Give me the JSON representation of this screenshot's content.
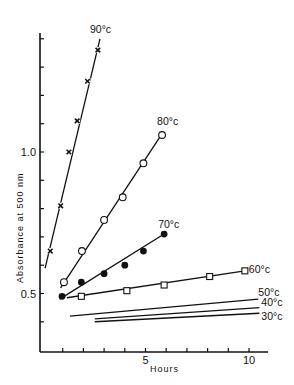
{
  "chart_data": {
    "type": "scatter",
    "title": "",
    "xlabel": "Hours",
    "ylabel": "Absorbance at 500 nm",
    "xlim": [
      0,
      11
    ],
    "ylim": [
      0.29,
      1.41
    ],
    "x_ticks": [
      1,
      2,
      3,
      4,
      5,
      6,
      7,
      8,
      9,
      10
    ],
    "x_tick_labels": [
      {
        "value": 5,
        "label": "5"
      },
      {
        "value": 10,
        "label": "10"
      }
    ],
    "y_ticks": [
      0.4,
      0.5,
      0.6,
      0.7,
      0.8,
      0.9,
      1.0,
      1.1,
      1.2,
      1.3,
      1.4
    ],
    "y_tick_labels": [
      {
        "value": 0.5,
        "label": "0.5"
      },
      {
        "value": 1.0,
        "label": "1.0"
      }
    ],
    "grid": false,
    "legend": "inline labels at line ends",
    "series": [
      {
        "name": "90°c",
        "marker": "cross",
        "x": [
          0.4,
          0.9,
          1.3,
          1.7,
          2.2,
          2.7
        ],
        "y": [
          0.65,
          0.81,
          1.0,
          1.11,
          1.25,
          1.36
        ],
        "fit_line": {
          "x": [
            0.15,
            2.8
          ],
          "y": [
            0.59,
            1.4
          ]
        }
      },
      {
        "name": "80°c",
        "marker": "open-circle",
        "x": [
          1.06,
          1.93,
          3.0,
          3.9,
          4.9,
          5.8
        ],
        "y": [
          0.54,
          0.65,
          0.76,
          0.84,
          0.96,
          1.06
        ],
        "fit_line": {
          "x": [
            0.9,
            5.85
          ],
          "y": [
            0.52,
            1.07
          ]
        }
      },
      {
        "name": "70°c",
        "marker": "filled-circle",
        "x": [
          0.97,
          1.9,
          3.0,
          4.0,
          4.9,
          5.9
        ],
        "y": [
          0.49,
          0.54,
          0.57,
          0.6,
          0.65,
          0.71
        ],
        "fit_line": {
          "x": [
            0.85,
            5.9
          ],
          "y": [
            0.48,
            0.71
          ]
        }
      },
      {
        "name": "60°c",
        "marker": "open-square",
        "x": [
          1.9,
          4.1,
          5.9,
          8.1,
          9.8
        ],
        "y": [
          0.49,
          0.51,
          0.53,
          0.56,
          0.58
        ],
        "fit_line": {
          "x": [
            1.2,
            9.8
          ],
          "y": [
            0.485,
            0.58
          ]
        }
      },
      {
        "name": "50°c",
        "marker": "none",
        "x": [],
        "y": [],
        "fit_line": {
          "x": [
            1.35,
            10.45
          ],
          "y": [
            0.42,
            0.48
          ]
        }
      },
      {
        "name": "40°c",
        "marker": "none",
        "x": [],
        "y": [],
        "fit_line": {
          "x": [
            2.55,
            10.5
          ],
          "y": [
            0.41,
            0.45
          ]
        }
      },
      {
        "name": "30°c",
        "marker": "none",
        "x": [],
        "y": [],
        "fit_line": {
          "x": [
            2.55,
            10.5
          ],
          "y": [
            0.4,
            0.43
          ]
        }
      }
    ]
  }
}
